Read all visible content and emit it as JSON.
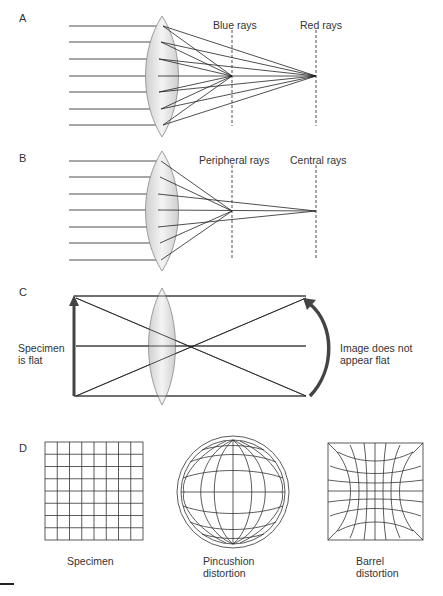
{
  "panels": {
    "a": {
      "label": "A",
      "blue_label": "Blue rays",
      "red_label": "Red rays"
    },
    "b": {
      "label": "B",
      "peripheral_label": "Peripheral rays",
      "central_label": "Central rays"
    },
    "c": {
      "label": "C",
      "specimen_line1": "Specimen",
      "specimen_line2": "is flat",
      "image_line1": "Image does not",
      "image_line2": "appear flat"
    },
    "d": {
      "label": "D",
      "specimen_caption": "Specimen",
      "pincushion_line1": "Pincushion",
      "pincushion_line2": "distortion",
      "barrel_line1": "Barrel",
      "barrel_line2": "distortion",
      "specimen_grid": {
        "rows": 8,
        "cols": 8
      }
    }
  },
  "colors": {
    "lens_fill": "#e4e4e4",
    "lens_stroke": "#888888",
    "ray": "#222222",
    "arrow": "#444444"
  }
}
